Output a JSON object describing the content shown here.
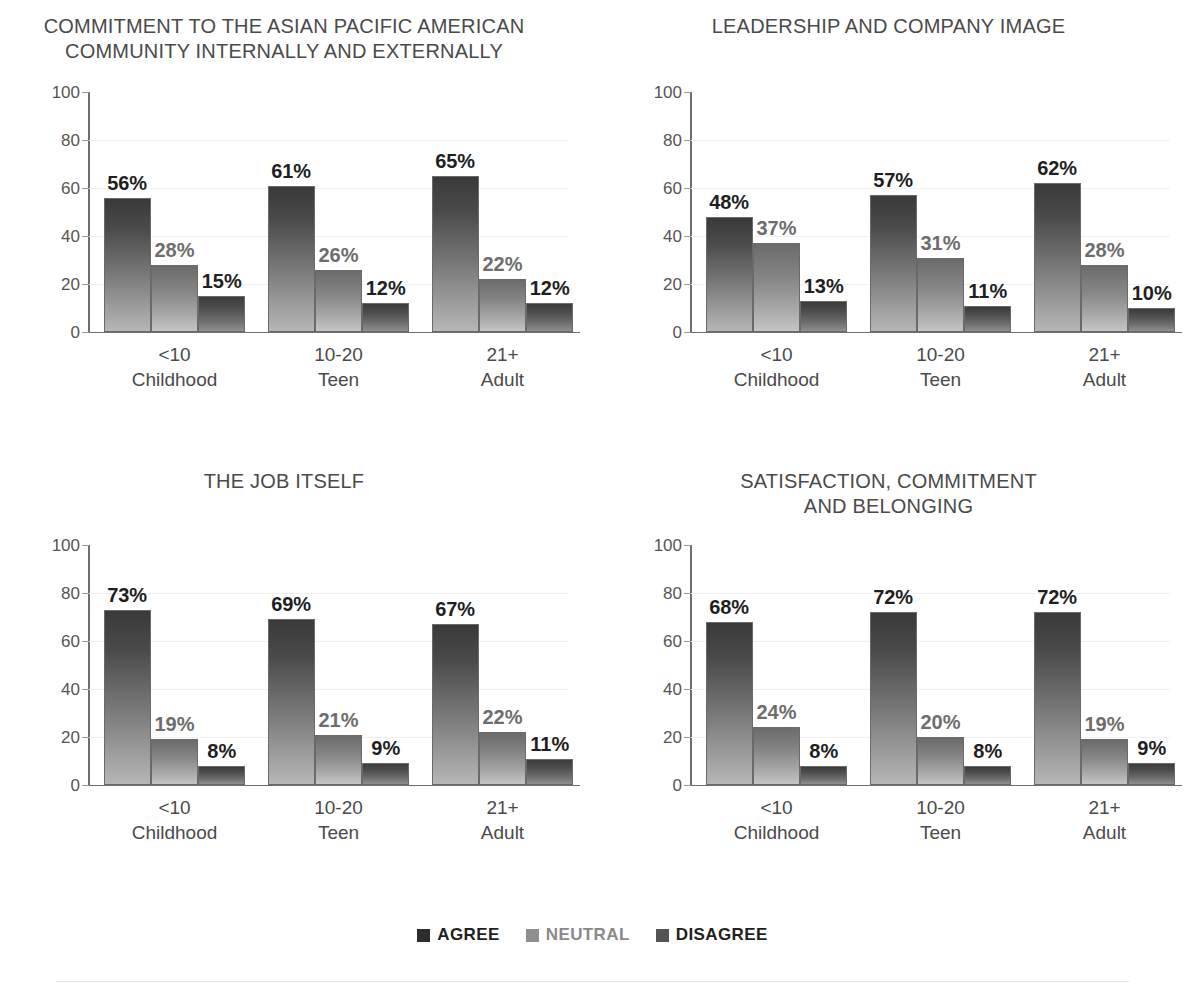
{
  "legend": {
    "items": [
      {
        "label": "AGREE",
        "color": "#2d2d2d"
      },
      {
        "label": "NEUTRAL",
        "color": "#8f8f8f"
      },
      {
        "label": "DISAGREE",
        "color": "#545454"
      }
    ]
  },
  "axis": {
    "ticks": [
      "100",
      "80",
      "60",
      "40",
      "20",
      "0"
    ],
    "categories": [
      {
        "range": "<10",
        "stage": "Childhood"
      },
      {
        "range": "10-20",
        "stage": "Teen"
      },
      {
        "range": "21+",
        "stage": "Adult"
      }
    ]
  },
  "panels": [
    {
      "title": "COMMITMENT TO THE ASIAN PACIFIC AMERICAN\nCOMMUNITY INTERNALLY AND EXTERNALLY",
      "labels": [
        [
          "56%",
          "28%",
          "15%"
        ],
        [
          "61%",
          "26%",
          "12%"
        ],
        [
          "65%",
          "22%",
          "12%"
        ]
      ]
    },
    {
      "title": "LEADERSHIP AND COMPANY IMAGE",
      "labels": [
        [
          "48%",
          "37%",
          "13%"
        ],
        [
          "57%",
          "31%",
          "11%"
        ],
        [
          "62%",
          "28%",
          "10%"
        ]
      ]
    },
    {
      "title": "THE JOB ITSELF",
      "labels": [
        [
          "73%",
          "19%",
          "8%"
        ],
        [
          "69%",
          "21%",
          "9%"
        ],
        [
          "67%",
          "22%",
          "11%"
        ]
      ]
    },
    {
      "title": "SATISFACTION, COMMITMENT\nAND BELONGING",
      "labels": [
        [
          "68%",
          "24%",
          "8%"
        ],
        [
          "72%",
          "20%",
          "8%"
        ],
        [
          "72%",
          "19%",
          "9%"
        ]
      ]
    }
  ],
  "chart_data": [
    {
      "type": "bar",
      "title": "COMMITMENT TO THE ASIAN PACIFIC AMERICAN COMMUNITY INTERNALLY AND EXTERNALLY",
      "categories": [
        "<10 Childhood",
        "10-20 Teen",
        "21+ Adult"
      ],
      "series": [
        {
          "name": "AGREE",
          "values": [
            56,
            61,
            65
          ]
        },
        {
          "name": "NEUTRAL",
          "values": [
            28,
            26,
            22
          ]
        },
        {
          "name": "DISAGREE",
          "values": [
            15,
            12,
            12
          ]
        }
      ],
      "xlabel": "",
      "ylabel": "",
      "ylim": [
        0,
        100
      ],
      "yticks": [
        0,
        20,
        40,
        60,
        80,
        100
      ],
      "grid": true,
      "legend_position": "bottom"
    },
    {
      "type": "bar",
      "title": "LEADERSHIP AND COMPANY IMAGE",
      "categories": [
        "<10 Childhood",
        "10-20 Teen",
        "21+ Adult"
      ],
      "series": [
        {
          "name": "AGREE",
          "values": [
            48,
            57,
            62
          ]
        },
        {
          "name": "NEUTRAL",
          "values": [
            37,
            31,
            28
          ]
        },
        {
          "name": "DISAGREE",
          "values": [
            13,
            11,
            10
          ]
        }
      ],
      "xlabel": "",
      "ylabel": "",
      "ylim": [
        0,
        100
      ],
      "yticks": [
        0,
        20,
        40,
        60,
        80,
        100
      ],
      "grid": true,
      "legend_position": "bottom"
    },
    {
      "type": "bar",
      "title": "THE JOB ITSELF",
      "categories": [
        "<10 Childhood",
        "10-20 Teen",
        "21+ Adult"
      ],
      "series": [
        {
          "name": "AGREE",
          "values": [
            73,
            69,
            67
          ]
        },
        {
          "name": "NEUTRAL",
          "values": [
            19,
            21,
            22
          ]
        },
        {
          "name": "DISAGREE",
          "values": [
            8,
            9,
            11
          ]
        }
      ],
      "xlabel": "",
      "ylabel": "",
      "ylim": [
        0,
        100
      ],
      "yticks": [
        0,
        20,
        40,
        60,
        80,
        100
      ],
      "grid": true,
      "legend_position": "bottom"
    },
    {
      "type": "bar",
      "title": "SATISFACTION, COMMITMENT AND BELONGING",
      "categories": [
        "<10 Childhood",
        "10-20 Teen",
        "21+ Adult"
      ],
      "series": [
        {
          "name": "AGREE",
          "values": [
            68,
            72,
            72
          ]
        },
        {
          "name": "NEUTRAL",
          "values": [
            24,
            20,
            19
          ]
        },
        {
          "name": "DISAGREE",
          "values": [
            8,
            8,
            9
          ]
        }
      ],
      "xlabel": "",
      "ylabel": "",
      "ylim": [
        0,
        100
      ],
      "yticks": [
        0,
        20,
        40,
        60,
        80,
        100
      ],
      "grid": true,
      "legend_position": "bottom"
    }
  ]
}
